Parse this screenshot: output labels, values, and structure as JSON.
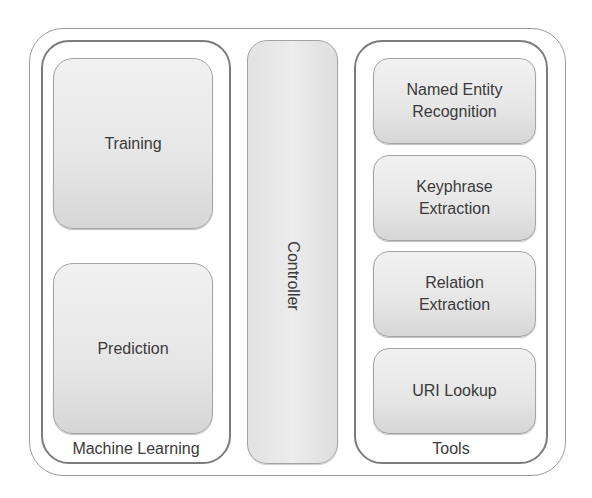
{
  "diagram": {
    "type": "architecture-block-diagram",
    "groups": [
      {
        "id": "machine-learning",
        "label": "Machine Learning",
        "components": [
          {
            "label": "Training"
          },
          {
            "label": "Prediction"
          }
        ]
      },
      {
        "id": "controller",
        "label": "Controller"
      },
      {
        "id": "tools",
        "label": "Tools",
        "components": [
          {
            "label_line1": "Named Entity",
            "label_line2": "Recognition"
          },
          {
            "label_line1": "Keyphrase",
            "label_line2": "Extraction"
          },
          {
            "label_line1": "Relation",
            "label_line2": "Extraction"
          },
          {
            "label_line1": "URI Lookup",
            "label_line2": ""
          }
        ]
      }
    ],
    "colors": {
      "border": "#8f8f8f",
      "module_fill_top": "#f1f1f1",
      "module_fill_bottom": "#d6d6d6",
      "text": "#3a3a3a"
    }
  }
}
